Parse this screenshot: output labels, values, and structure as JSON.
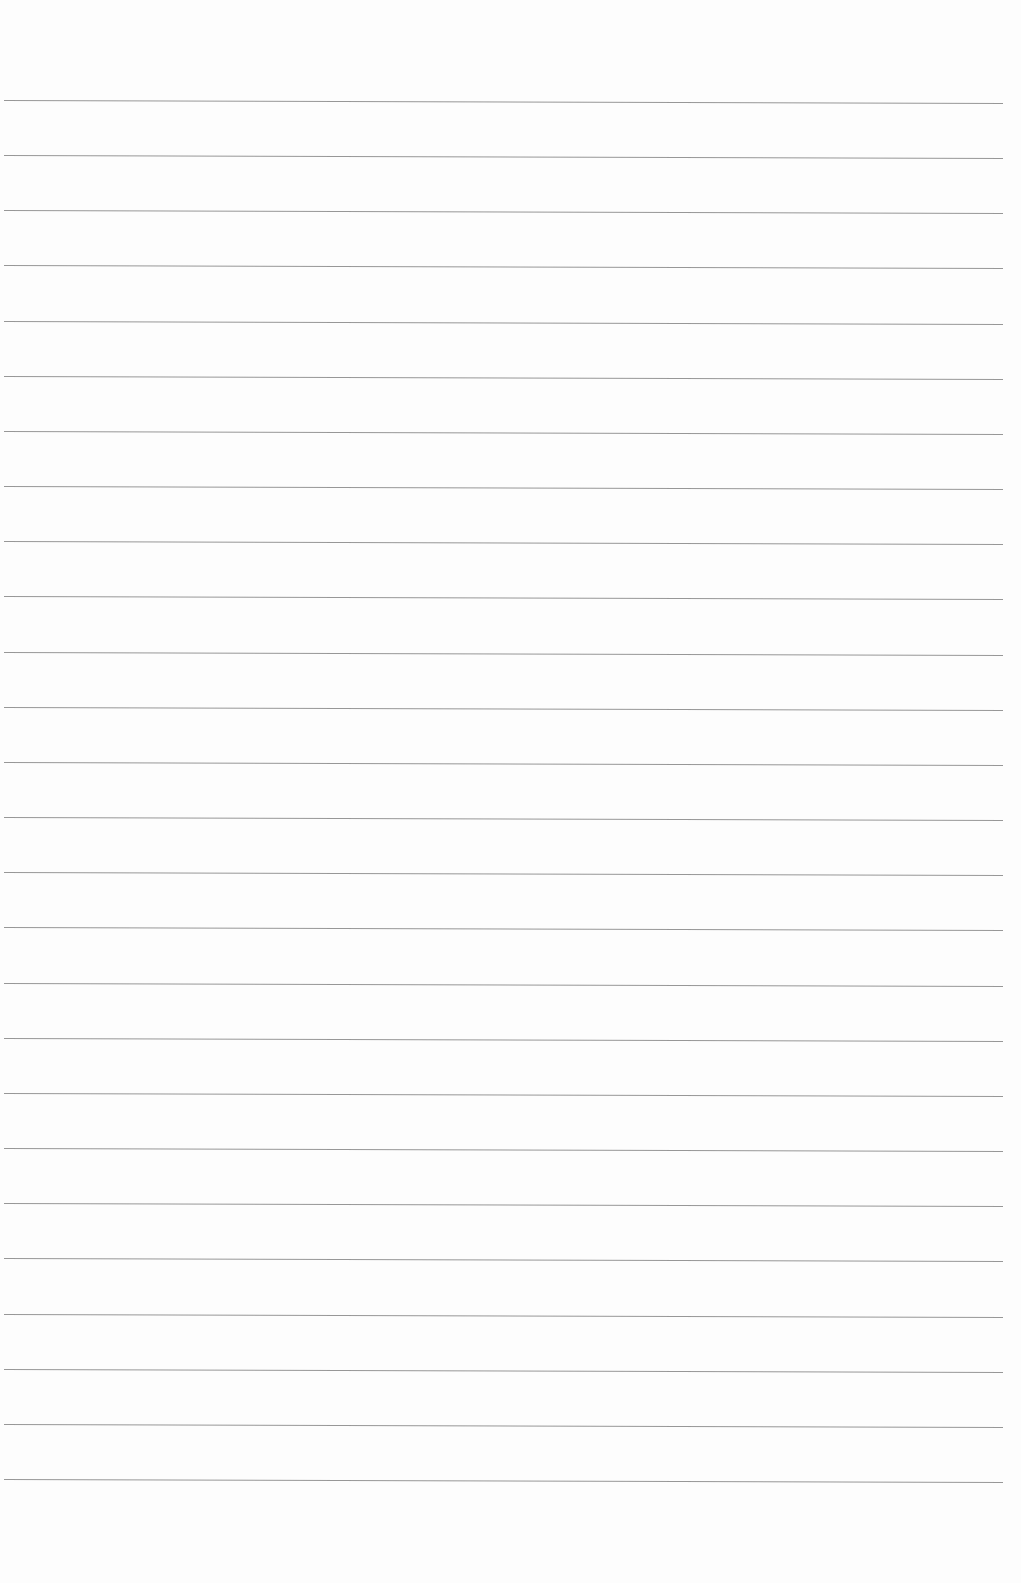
{
  "page": {
    "type": "lined-paper",
    "background_color": "#fdfdfd",
    "line_color": "#8c8c8c",
    "line_count": 26,
    "first_line_y": 100,
    "line_spacing": 55.16,
    "line_left_x": 4,
    "line_width": 999,
    "text": ""
  }
}
